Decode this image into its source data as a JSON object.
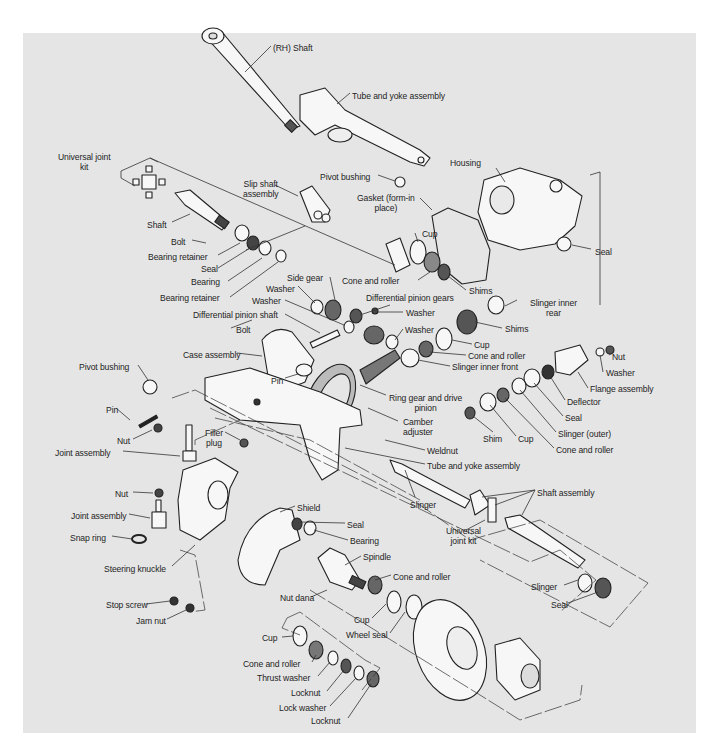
{
  "diagram": {
    "title": "",
    "type": "exploded-view",
    "colors": {
      "panel": "#e5e5e5",
      "ink": "#1e1e1e",
      "page": "#ffffff"
    },
    "labels": [
      {
        "id": "rh-shaft",
        "text": "(RH) Shaft",
        "x": 273,
        "y": 43
      },
      {
        "id": "tube-yoke-top",
        "text": "Tube and yoke assembly",
        "x": 352,
        "y": 91
      },
      {
        "id": "universal-joint-kit-top",
        "text": "Universal joint\nkit",
        "x": 58,
        "y": 152,
        "align": "c"
      },
      {
        "id": "pivot-bushing-top",
        "text": "Pivot bushing",
        "x": 320,
        "y": 172
      },
      {
        "id": "slip-shaft",
        "text": "Slip shaft\nassembly",
        "x": 243,
        "y": 179,
        "align": "c"
      },
      {
        "id": "housing",
        "text": "Housing",
        "x": 450,
        "y": 158
      },
      {
        "id": "gasket",
        "text": "Gasket (form-in\nplace)",
        "x": 357,
        "y": 193,
        "align": "c"
      },
      {
        "id": "shaft-left",
        "text": "Shaft",
        "x": 147,
        "y": 220
      },
      {
        "id": "cup-top",
        "text": "Cup",
        "x": 422,
        "y": 229
      },
      {
        "id": "seal-housing",
        "text": "Seal",
        "x": 595,
        "y": 247
      },
      {
        "id": "bolt-top",
        "text": "Bolt",
        "x": 171,
        "y": 237
      },
      {
        "id": "bearing-retainer-1",
        "text": "Bearing retainer",
        "x": 148,
        "y": 252
      },
      {
        "id": "cone-roller-top",
        "text": "Cone and roller",
        "x": 342,
        "y": 276
      },
      {
        "id": "shims-top",
        "text": "Shims",
        "x": 469,
        "y": 286
      },
      {
        "id": "seal-left",
        "text": "Seal",
        "x": 201,
        "y": 264
      },
      {
        "id": "side-gear",
        "text": "Side gear",
        "x": 287,
        "y": 273
      },
      {
        "id": "bearing-left",
        "text": "Bearing",
        "x": 191,
        "y": 277
      },
      {
        "id": "washer-1",
        "text": "Washer",
        "x": 266,
        "y": 284
      },
      {
        "id": "slinger-inner-rear",
        "text": "Slinger inner\nrear",
        "x": 530,
        "y": 298,
        "align": "c"
      },
      {
        "id": "bearing-retainer-2",
        "text": "Bearing retainer",
        "x": 160,
        "y": 293
      },
      {
        "id": "differential-pinion-gears",
        "text": "Differential pinion gears",
        "x": 366,
        "y": 293
      },
      {
        "id": "washer-2",
        "text": "Washer",
        "x": 252,
        "y": 296
      },
      {
        "id": "differential-pinion-shaft",
        "text": "Differential pinion shaft",
        "x": 193,
        "y": 310
      },
      {
        "id": "washer-3",
        "text": "Washer",
        "x": 406,
        "y": 308
      },
      {
        "id": "shims-mid",
        "text": "Shims",
        "x": 505,
        "y": 324
      },
      {
        "id": "bolt-mid",
        "text": "Bolt",
        "x": 236,
        "y": 325
      },
      {
        "id": "washer-4",
        "text": "Washer",
        "x": 405,
        "y": 325
      },
      {
        "id": "cup-mid",
        "text": "Cup",
        "x": 474,
        "y": 340
      },
      {
        "id": "case-assembly",
        "text": "Case assembly",
        "x": 183,
        "y": 350
      },
      {
        "id": "cone-roller-mid",
        "text": "Cone and roller",
        "x": 468,
        "y": 351
      },
      {
        "id": "nut-right",
        "text": "Nut",
        "x": 612,
        "y": 352
      },
      {
        "id": "slinger-inner-front",
        "text": "Slinger inner front",
        "x": 452,
        "y": 362
      },
      {
        "id": "washer-right",
        "text": "Washer",
        "x": 606,
        "y": 368
      },
      {
        "id": "pivot-bushing-left",
        "text": "Pivot bushing",
        "x": 79,
        "y": 362
      },
      {
        "id": "pin-top",
        "text": "Pin",
        "x": 271,
        "y": 376
      },
      {
        "id": "ring-gear",
        "text": "Ring gear and drive\npinion",
        "x": 389,
        "y": 393,
        "align": "c"
      },
      {
        "id": "flange-assembly",
        "text": "Flange assembly",
        "x": 590,
        "y": 384
      },
      {
        "id": "deflector",
        "text": "Deflector",
        "x": 567,
        "y": 397
      },
      {
        "id": "seal-right",
        "text": "Seal",
        "x": 565,
        "y": 413
      },
      {
        "id": "pin-left",
        "text": "Pin",
        "x": 106,
        "y": 405
      },
      {
        "id": "slinger-outer",
        "text": "Slinger (outer)",
        "x": 558,
        "y": 429
      },
      {
        "id": "shim",
        "text": "Shim",
        "x": 483,
        "y": 434
      },
      {
        "id": "cup-right",
        "text": "Cup",
        "x": 518,
        "y": 434
      },
      {
        "id": "camber-adjuster",
        "text": "Camber\nadjuster",
        "x": 403,
        "y": 417,
        "align": "c"
      },
      {
        "id": "nut-left",
        "text": "Nut",
        "x": 117,
        "y": 436
      },
      {
        "id": "filler-plug",
        "text": "Filler\nplug",
        "x": 205,
        "y": 428,
        "align": "c"
      },
      {
        "id": "cone-roller-right",
        "text": "Cone and roller",
        "x": 556,
        "y": 445
      },
      {
        "id": "joint-assembly-top",
        "text": "Joint assembly",
        "x": 55,
        "y": 448
      },
      {
        "id": "weldnut",
        "text": "Weldnut",
        "x": 427,
        "y": 446
      },
      {
        "id": "tube-yoke-mid",
        "text": "Tube and yoke assembly",
        "x": 427,
        "y": 461
      },
      {
        "id": "nut-mid",
        "text": "Nut",
        "x": 115,
        "y": 489
      },
      {
        "id": "shaft-assembly",
        "text": "Shaft assembly",
        "x": 537,
        "y": 488
      },
      {
        "id": "slinger-mid",
        "text": "Slinger",
        "x": 410,
        "y": 500
      },
      {
        "id": "shield",
        "text": "Shield",
        "x": 297,
        "y": 503
      },
      {
        "id": "joint-assembly-bottom",
        "text": "Joint assembly",
        "x": 71,
        "y": 511
      },
      {
        "id": "seal-spindle",
        "text": "Seal",
        "x": 347,
        "y": 520
      },
      {
        "id": "universal-joint-kit-bottom",
        "text": "Universal\njoint kit",
        "x": 446,
        "y": 526,
        "align": "c"
      },
      {
        "id": "snap-ring",
        "text": "Snap ring",
        "x": 70,
        "y": 533
      },
      {
        "id": "bearing-spindle",
        "text": "Bearing",
        "x": 350,
        "y": 536
      },
      {
        "id": "steering-knuckle",
        "text": "Steering knuckle",
        "x": 104,
        "y": 564
      },
      {
        "id": "spindle",
        "text": "Spindle",
        "x": 363,
        "y": 552
      },
      {
        "id": "slinger-bottom",
        "text": "Slinger",
        "x": 531,
        "y": 582
      },
      {
        "id": "cone-roller-spindle",
        "text": "Cone and roller",
        "x": 393,
        "y": 572
      },
      {
        "id": "seal-bottom",
        "text": "Seal",
        "x": 551,
        "y": 600
      },
      {
        "id": "stop-screw",
        "text": "Stop screw",
        "x": 106,
        "y": 600
      },
      {
        "id": "nut-dana",
        "text": "Nut dana",
        "x": 280,
        "y": 593
      },
      {
        "id": "jam-nut",
        "text": "Jam nut",
        "x": 136,
        "y": 616
      },
      {
        "id": "cup-spindle",
        "text": "Cup",
        "x": 354,
        "y": 615
      },
      {
        "id": "wheel-seal",
        "text": "Wheel seal",
        "x": 346,
        "y": 630
      },
      {
        "id": "cup-lower",
        "text": "Cup",
        "x": 262,
        "y": 633
      },
      {
        "id": "cone-roller-lower",
        "text": "Cone and roller",
        "x": 243,
        "y": 659
      },
      {
        "id": "thrust-washer",
        "text": "Thrust washer",
        "x": 257,
        "y": 673
      },
      {
        "id": "locknut-1",
        "text": "Locknut",
        "x": 291,
        "y": 688
      },
      {
        "id": "lock-washer",
        "text": "Lock washer",
        "x": 279,
        "y": 703
      },
      {
        "id": "locknut-2",
        "text": "Locknut",
        "x": 311,
        "y": 716
      }
    ]
  }
}
